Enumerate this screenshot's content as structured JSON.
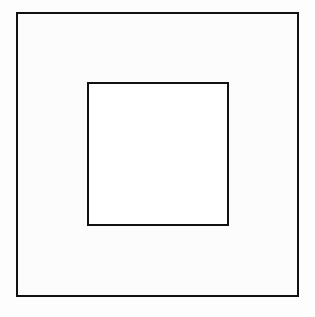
{
  "diagram": {
    "shapes": [
      {
        "id": "outer-square",
        "type": "square",
        "stroke": "#111111",
        "fill": "#fcfcfc"
      },
      {
        "id": "inner-square",
        "type": "square",
        "stroke": "#111111",
        "fill": "#ffffff"
      }
    ]
  }
}
